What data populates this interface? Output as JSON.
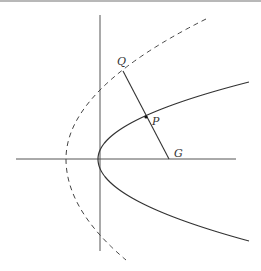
{
  "diagram": {
    "colors": {
      "stroke": "#333333",
      "axis": "#555555",
      "background": "#ffffff",
      "border": "#b8b8b8"
    },
    "labels": {
      "Q": "Q",
      "P": "P",
      "G": "G"
    },
    "points": {
      "Q": [
        123,
        71
      ],
      "P": [
        146,
        117
      ],
      "G": [
        169,
        159
      ],
      "vertex": [
        98,
        159
      ],
      "dashed_vertex": [
        66,
        159
      ]
    },
    "axes": {
      "horizontal": {
        "x1": 16,
        "y": 159,
        "x2": 236
      },
      "vertical": {
        "x": 100,
        "y1": 15,
        "y2": 251
      }
    },
    "curves": {
      "parabola": {
        "style": "solid",
        "vertex": [
          98,
          159
        ],
        "upper_end": [
          249,
          82
        ],
        "lower_end": [
          249,
          241
        ]
      },
      "dashed_parabola": {
        "style": "dashed",
        "vertex": [
          66,
          159
        ],
        "upper_end": [
          206,
          19
        ],
        "lower_end": [
          126,
          260
        ]
      }
    }
  }
}
